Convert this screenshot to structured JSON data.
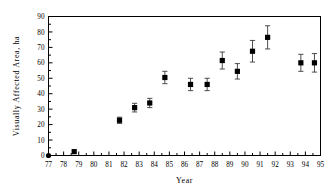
{
  "chart_data": {
    "type": "scatter",
    "title": "",
    "xlabel": "Year",
    "ylabel": "Visually Affected Area, ha",
    "xlim": [
      77,
      95
    ],
    "ylim": [
      0,
      90
    ],
    "xticks": [
      "77",
      "78",
      "79",
      "80",
      "81",
      "82",
      "83",
      "84",
      "85",
      "86",
      "87",
      "88",
      "89",
      "90",
      "91",
      "92",
      "93",
      "94",
      "95"
    ],
    "yticks": [
      "0",
      "10",
      "20",
      "30",
      "40",
      "50",
      "60",
      "70",
      "80",
      "90"
    ],
    "grid": false,
    "legend": null,
    "marker": "filled-square",
    "marker_color": "#000000",
    "error_bars": "vertical",
    "points": [
      {
        "x": 77.0,
        "y": 0.0,
        "err": 0.0,
        "marker": "filled-circle"
      },
      {
        "x": 78.7,
        "y": 2.5,
        "err": 0.0,
        "marker": "filled-square"
      },
      {
        "x": 81.7,
        "y": 22.8,
        "err": 2.0,
        "marker": "filled-square"
      },
      {
        "x": 82.7,
        "y": 31.0,
        "err": 2.8,
        "marker": "filled-square"
      },
      {
        "x": 83.7,
        "y": 34.0,
        "err": 3.0,
        "marker": "filled-square"
      },
      {
        "x": 84.7,
        "y": 50.5,
        "err": 4.0,
        "marker": "filled-square"
      },
      {
        "x": 86.4,
        "y": 46.0,
        "err": 4.0,
        "marker": "filled-square"
      },
      {
        "x": 87.5,
        "y": 46.0,
        "err": 4.0,
        "marker": "filled-square"
      },
      {
        "x": 88.5,
        "y": 61.5,
        "err": 5.5,
        "marker": "filled-square"
      },
      {
        "x": 89.5,
        "y": 54.5,
        "err": 5.0,
        "marker": "filled-square"
      },
      {
        "x": 90.5,
        "y": 67.5,
        "err": 7.0,
        "marker": "filled-square"
      },
      {
        "x": 91.5,
        "y": 76.5,
        "err": 7.5,
        "marker": "filled-square"
      },
      {
        "x": 93.7,
        "y": 60.0,
        "err": 5.5,
        "marker": "filled-square"
      },
      {
        "x": 94.6,
        "y": 60.0,
        "err": 6.0,
        "marker": "filled-square"
      }
    ]
  },
  "figure": {
    "background": "#ffffff",
    "axis_color": "#000000"
  }
}
